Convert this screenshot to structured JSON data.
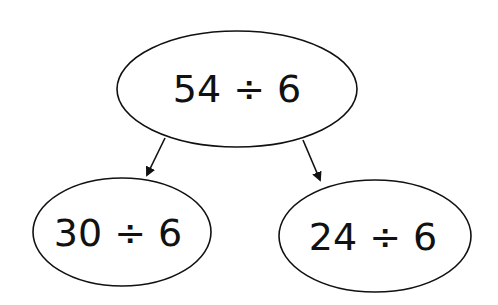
{
  "diagram": {
    "type": "decomposition-tree",
    "stroke_color": "#111111",
    "background": "#ffffff",
    "root": {
      "label": "54 ÷ 6"
    },
    "children": [
      {
        "label": "30 ÷ 6"
      },
      {
        "label": "24 ÷ 6"
      }
    ]
  }
}
